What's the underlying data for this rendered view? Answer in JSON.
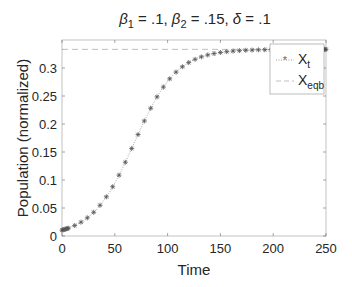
{
  "chart_data": {
    "type": "scatter",
    "title_parts": {
      "b1": "β",
      "b1_sub": "1",
      "b1_val": " = .1, ",
      "b2": "β",
      "b2_sub": "2",
      "b2_val": " = .15, ",
      "d": "δ",
      "d_val": " = .1"
    },
    "xlabel": "Time",
    "ylabel": "Population (normalized)",
    "xlim": [
      0,
      250
    ],
    "ylim": [
      0,
      0.35
    ],
    "xticks": [
      0,
      50,
      100,
      150,
      200,
      250
    ],
    "xtick_labels": [
      "0",
      "50",
      "100",
      "150",
      "200",
      "250"
    ],
    "yticks": [
      0,
      0.05,
      0.1,
      0.15,
      0.2,
      0.25,
      0.3
    ],
    "ytick_labels": [
      "0",
      "0.05",
      "0.1",
      "0.15",
      "0.2",
      "0.25",
      "0.3"
    ],
    "grid": false,
    "legend_position": "northeast",
    "series": [
      {
        "name": "X_t",
        "label_main": "X",
        "label_sub": "t",
        "style": "dotted line with asterisk markers",
        "color": "#7f7f7f",
        "logistic": {
          "K": 0.3333,
          "x0": 0.0105,
          "r": 0.05,
          "t_start": 0,
          "t_end": 250,
          "step": 6
        }
      },
      {
        "name": "X_eqb",
        "label_main": "X",
        "label_sub": "eqb",
        "style": "dashed line",
        "color": "#bfbfbf",
        "value": 0.3333
      }
    ]
  }
}
